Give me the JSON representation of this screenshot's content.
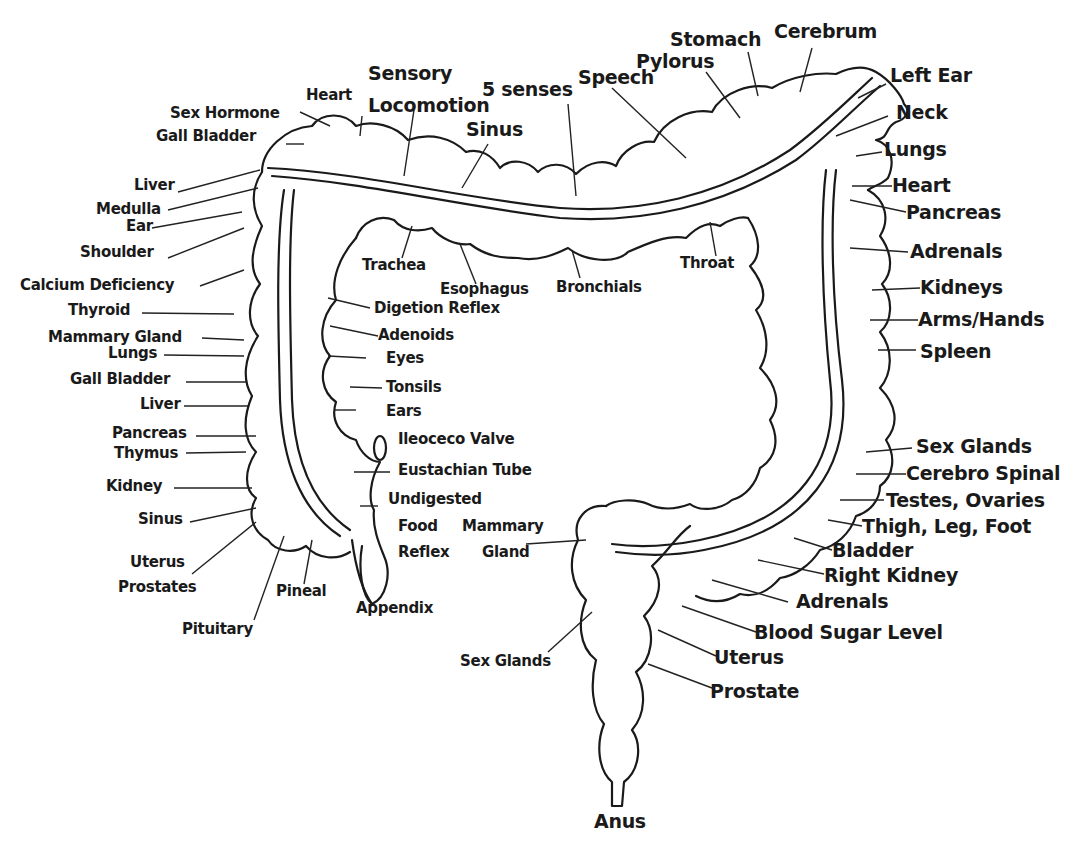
{
  "diagram": {
    "colors": {
      "ink": "#1a1a1a",
      "background": "#ffffff"
    },
    "labels": {
      "top": {
        "sensory": "Sensory",
        "locomotion": "Locomotion",
        "heart": "Heart",
        "sex_hormone": "Sex Hormone",
        "gall_bladder": "Gall Bladder",
        "five_senses": "5 senses",
        "sinus": "Sinus",
        "speech": "Speech",
        "pylorus": "Pylorus",
        "stomach": "Stomach",
        "cerebrum": "Cerebrum"
      },
      "right_upper": {
        "left_ear": "Left Ear",
        "neck": "Neck",
        "lungs": "Lungs",
        "heart": "Heart",
        "pancreas": "Pancreas",
        "adrenals": "Adrenals",
        "kidneys": "Kidneys",
        "arms_hands": "Arms/Hands",
        "spleen": "Spleen"
      },
      "right_lower": {
        "sex_glands": "Sex Glands",
        "cerebro_spinal": "Cerebro Spinal",
        "testes_ovaries": "Testes, Ovaries",
        "thigh_leg_foot": "Thigh, Leg, Foot",
        "bladder": "Bladder",
        "right_kidney": "Right Kidney",
        "adrenals": "Adrenals",
        "blood_sugar_level": "Blood Sugar Level",
        "uterus": "Uterus",
        "prostate": "Prostate"
      },
      "left_outer": {
        "liver_top": "Liver",
        "medulla": "Medulla",
        "ear": "Ear",
        "shoulder": "Shoulder",
        "calcium_deficiency": "Calcium Deficiency",
        "thyroid": "Thyroid",
        "mammary_gland": "Mammary Gland",
        "lungs": "Lungs",
        "gall_bladder": "Gall Bladder",
        "liver": "Liver",
        "pancreas": "Pancreas",
        "thymus": "Thymus",
        "kidney": "Kidney",
        "sinus": "Sinus",
        "uterus": "Uterus",
        "prostates": "Prostates",
        "pituitary": "Pituitary",
        "pineal": "Pineal",
        "appendix": "Appendix"
      },
      "inner": {
        "trachea": "Trachea",
        "esophagus": "Esophagus",
        "bronchials": "Bronchials",
        "throat": "Throat",
        "digestion_reflex": "Digetion Reflex",
        "adenoids": "Adenoids",
        "eyes": "Eyes",
        "tonsils": "Tonsils",
        "ears": "Ears",
        "ileoceco_valve": "Ileoceco Valve",
        "eustachian_tube": "Eustachian Tube",
        "undigested": "Undigested",
        "food": "Food",
        "reflex": "Reflex",
        "mammary": "Mammary",
        "gland": "Gland"
      },
      "bottom": {
        "sex_glands": "Sex Glands",
        "anus": "Anus"
      }
    }
  }
}
